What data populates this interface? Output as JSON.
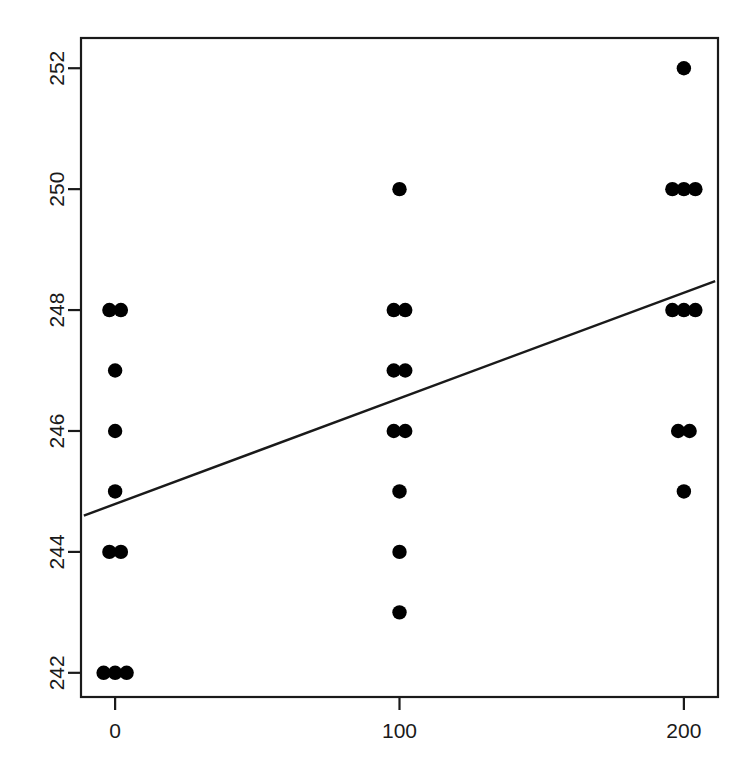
{
  "chart_data": {
    "type": "scatter",
    "title": "",
    "subtitle": "",
    "xlabel": "",
    "ylabel": "",
    "xlim": [
      -12,
      212
    ],
    "ylim": [
      241.6,
      252.5
    ],
    "xticks": [
      0,
      100,
      200
    ],
    "yticks": [
      242,
      244,
      246,
      248,
      250,
      252
    ],
    "xtick_labels": [
      "0",
      "100",
      "200"
    ],
    "ytick_labels": [
      "242",
      "244",
      "246",
      "248",
      "250",
      "252"
    ],
    "grid": false,
    "legend": null,
    "legend_position": "none",
    "point_color": "#000000",
    "line_color": "#1a1a1a",
    "axis_color": "#1a1a1a",
    "background_color": "#ffffff",
    "ytick_label_rotation": -90,
    "box_border": true,
    "series": [
      {
        "name": "observations",
        "marker": "filled-circle",
        "points": [
          {
            "x": 0,
            "y": 248,
            "count": 2
          },
          {
            "x": 0,
            "y": 247,
            "count": 1
          },
          {
            "x": 0,
            "y": 246,
            "count": 1
          },
          {
            "x": 0,
            "y": 245,
            "count": 1
          },
          {
            "x": 0,
            "y": 244,
            "count": 2
          },
          {
            "x": 0,
            "y": 242,
            "count": 3
          },
          {
            "x": 100,
            "y": 250,
            "count": 1
          },
          {
            "x": 100,
            "y": 248,
            "count": 2
          },
          {
            "x": 100,
            "y": 247,
            "count": 2
          },
          {
            "x": 100,
            "y": 246,
            "count": 2
          },
          {
            "x": 100,
            "y": 245,
            "count": 1
          },
          {
            "x": 100,
            "y": 244,
            "count": 1
          },
          {
            "x": 100,
            "y": 243,
            "count": 1
          },
          {
            "x": 200,
            "y": 252,
            "count": 1
          },
          {
            "x": 200,
            "y": 250,
            "count": 3
          },
          {
            "x": 200,
            "y": 248,
            "count": 3
          },
          {
            "x": 200,
            "y": 246,
            "count": 2
          },
          {
            "x": 200,
            "y": 245,
            "count": 1
          }
        ]
      }
    ],
    "regression_line": {
      "name": "fitted-line",
      "x_start": -11,
      "y_start": 244.6,
      "x_end": 211,
      "y_end": 248.48,
      "slope": 0.01748,
      "intercept": 244.79
    }
  }
}
